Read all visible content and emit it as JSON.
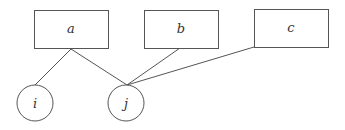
{
  "diagram": {
    "type": "bipartite-graph",
    "boxes": [
      {
        "id": "a",
        "label": "a",
        "x": 34,
        "y": 10,
        "w": 74,
        "h": 38
      },
      {
        "id": "b",
        "label": "b",
        "x": 144,
        "y": 10,
        "w": 74,
        "h": 38
      },
      {
        "id": "c",
        "label": "c",
        "x": 254,
        "y": 9,
        "w": 74,
        "h": 38
      }
    ],
    "circles": [
      {
        "id": "i",
        "label": "i",
        "cx": 35,
        "cy": 103,
        "r": 18
      },
      {
        "id": "j",
        "label": "j",
        "cx": 126,
        "cy": 103,
        "r": 18
      }
    ],
    "edges": [
      {
        "from": "a",
        "to": "i"
      },
      {
        "from": "a",
        "to": "j"
      },
      {
        "from": "b",
        "to": "j"
      },
      {
        "from": "c",
        "to": "j"
      }
    ]
  }
}
